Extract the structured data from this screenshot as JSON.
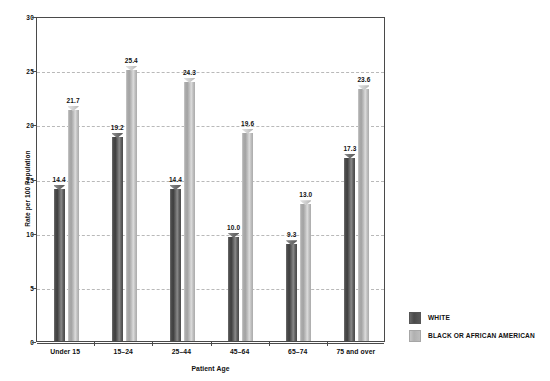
{
  "chart_data": {
    "type": "bar",
    "title": "",
    "subtitle": "",
    "xlabel": "Patient Age",
    "ylabel": "Rate per 100 Population",
    "categories": [
      "Under 15",
      "15–24",
      "25–44",
      "45–64",
      "65–74",
      "75 and over"
    ],
    "series": [
      {
        "name": "WHITE",
        "color": "#4a4a4a",
        "values": [
          14.4,
          19.2,
          14.4,
          10.0,
          9.3,
          17.3
        ],
        "labels": [
          "14.4",
          "19.2",
          "14.4",
          "10.0",
          "9.3",
          "17.3"
        ]
      },
      {
        "name": "BLACK OR AFRICAN AMERICAN",
        "color": "#b0b0b0",
        "values": [
          21.7,
          25.4,
          24.3,
          19.6,
          13.0,
          23.6
        ],
        "labels": [
          "21.7",
          "25.4",
          "24.3",
          "19.6",
          "13.0",
          "23.6"
        ]
      }
    ],
    "ylim": [
      0,
      30
    ],
    "yticks": [
      0,
      5,
      10,
      15,
      20,
      25,
      30
    ],
    "ytick_labels": [
      "0",
      "5",
      "10",
      "15",
      "20",
      "25",
      "30"
    ],
    "grid": "horizontal-dashed",
    "legend_position": "right-bottom"
  },
  "legend": {
    "items": [
      {
        "label": "WHITE",
        "swatch": "dark-gray-swatch"
      },
      {
        "label": "BLACK OR AFRICAN AMERICAN",
        "swatch": "light-gray-swatch"
      }
    ]
  },
  "axes": {
    "y_title": "Rate per 100 Population",
    "x_title": "Patient Age"
  }
}
